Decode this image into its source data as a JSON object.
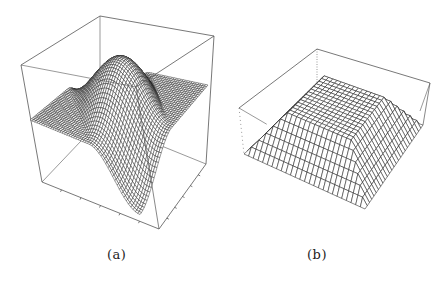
{
  "figure": {
    "panels": [
      {
        "id": "a",
        "label": "(a)",
        "description": "3D wireframe surface plot inside a bounding box: flat plane with a single wave (positive lobe behind, negative lobe in front) along a diagonal",
        "box": {
          "top_back": [
            100,
            16
          ],
          "top_left": [
            21,
            65
          ],
          "top_right": [
            214,
            36
          ],
          "top_front": [
            136,
            87
          ],
          "bottom_back": [
            100,
            121
          ],
          "bottom_left": [
            42,
            182
          ],
          "bottom_right": [
            206,
            164
          ],
          "bottom_front": [
            159,
            229
          ]
        },
        "surface": {
          "plane_corners": {
            "back": [
              100,
              62
            ],
            "left": [
              30,
              120
            ],
            "right": [
              208,
              85
            ],
            "front": [
              140,
              165
            ]
          },
          "grid_n": 48,
          "amplitude_px": 55,
          "wave": "a single sine period along one diagonal"
        }
      },
      {
        "id": "b",
        "label": "(b)",
        "description": "3D wireframe truncated-pyramid (flat-topped) surface inside a bounding box",
        "box": {
          "top_back": [
            317,
            49
          ],
          "top_left": [
            239,
            108
          ],
          "top_right": [
            430,
            83
          ],
          "bottom_back": [
            317,
            88
          ],
          "bottom_left": [
            244,
            154
          ],
          "bottom_right": [
            423,
            125
          ],
          "bottom_front": [
            365,
            209
          ]
        },
        "surface": {
          "base_corners": {
            "back": [
              315,
              90
            ],
            "left": [
              244,
              154
            ],
            "right": [
              423,
              125
            ],
            "front": [
              365,
              209
            ]
          },
          "plateau_fraction": 0.55,
          "height_px": 38,
          "grid_n": 26
        }
      }
    ],
    "stroke_color": "#222222",
    "box_color": "#555555",
    "background": "#ffffff"
  }
}
